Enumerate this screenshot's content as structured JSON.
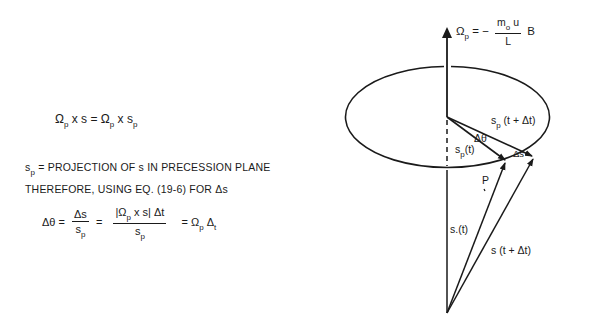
{
  "left_panel": {
    "eq1": {
      "lhs_omega": "Ω",
      "lhs_sub": "p",
      "lhs_rest": " x s = ",
      "rhs_omega": "Ω",
      "rhs_sub": "p",
      "rhs_mid": " x s",
      "rhs_sub2": "p"
    },
    "definition": {
      "s": "s",
      "s_sub": "p",
      "text": " = PROJECTION OF s IN PRECESSION PLANE"
    },
    "therefore_line": "THEREFORE, USING EQ. (19-6) FOR Δs",
    "eq2": {
      "lhs": "Δθ =",
      "frac1_num": "Δs",
      "frac1_den": "s",
      "frac1_den_sub": "p",
      "eq_sign": "=",
      "frac2_num_a": "|Ω",
      "frac2_num_sub": "p",
      "frac2_num_b": " x  s|  Δt",
      "frac2_den": "s",
      "frac2_den_sub": "p",
      "rhs_a": "= Ω",
      "rhs_sub": "p",
      "rhs_b": " Δ",
      "rhs_sub2": "t"
    }
  },
  "diagram": {
    "omega_label": {
      "omega": "Ω",
      "sub": "p",
      "eq": " = −",
      "num": "m",
      "num_sub": "o",
      "num_rest": " u",
      "den": "L",
      "tail": "B"
    },
    "labels": {
      "sp_t_dt": "s",
      "sp_t_dt_sub": "p",
      "sp_t_dt_rest": " (t + Δt)",
      "delta_theta": "Δθ",
      "sp_t": "s",
      "sp_t_sub": "p",
      "sp_t_rest": "(t)",
      "delta_s": "Δs",
      "P": "P",
      "s_t": "s.(t)",
      "s_t_dt": "s (t + Δt)"
    },
    "stroke_color": "#1a1a1a"
  }
}
